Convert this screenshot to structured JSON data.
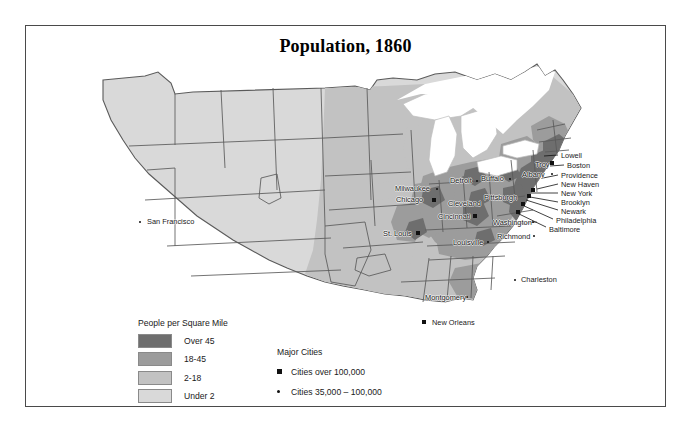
{
  "map": {
    "title": "Population, 1860",
    "colors": {
      "over45": "#6e6e6e",
      "d18_45": "#9c9c9c",
      "d2_18": "#c2c2c2",
      "under2": "#d9d9d9",
      "water": "#ffffff",
      "border": "#4a4a4a",
      "marker": "#111111"
    },
    "legend_density": {
      "title": "People per Square Mile",
      "classes": [
        {
          "label": "Over 45",
          "color": "#6e6e6e"
        },
        {
          "label": "18-45",
          "color": "#9c9c9c"
        },
        {
          "label": "2-18",
          "color": "#c2c2c2"
        },
        {
          "label": "Under 2",
          "color": "#d9d9d9"
        }
      ]
    },
    "legend_cities": {
      "title": "Major Cities",
      "classes": [
        {
          "label": "Cities over 100,000",
          "marker": "square-marker"
        },
        {
          "label": "Cities 35,000 – 100,000",
          "marker": "dot-marker"
        }
      ]
    },
    "cities": [
      {
        "name": "San Francisco",
        "marker": "dot-marker",
        "mx": 115,
        "my": 172,
        "lx": 122,
        "ly": 168
      },
      {
        "name": "Milwaukee",
        "marker": "dot-marker",
        "mx": 412,
        "my": 139,
        "lx": 370,
        "ly": 135
      },
      {
        "name": "Chicago",
        "marker": "square-marker",
        "mx": 409,
        "my": 150,
        "lx": 371,
        "ly": 146
      },
      {
        "name": "St. Louis",
        "marker": "square-marker",
        "mx": 393,
        "my": 183,
        "lx": 358,
        "ly": 180
      },
      {
        "name": "Detroit",
        "marker": "dot-marker",
        "mx": 452,
        "my": 131,
        "lx": 425,
        "ly": 127
      },
      {
        "name": "Buffalo",
        "marker": "dot-marker",
        "mx": 485,
        "my": 129,
        "lx": 456,
        "ly": 125
      },
      {
        "name": "Cleveland",
        "marker": "dot-marker",
        "mx": 453,
        "my": 152,
        "lx": 423,
        "ly": 150
      },
      {
        "name": "Cincinnati",
        "marker": "square-marker",
        "mx": 450,
        "my": 166,
        "lx": 413,
        "ly": 163
      },
      {
        "name": "Pittsburgh",
        "marker": "dot-marker",
        "mx": 487,
        "my": 147,
        "lx": 459,
        "ly": 144
      },
      {
        "name": "Louisville",
        "marker": "dot-marker",
        "mx": 463,
        "my": 192,
        "lx": 428,
        "ly": 189
      },
      {
        "name": "Washington",
        "marker": "dot-marker",
        "mx": 508,
        "my": 172,
        "lx": 468,
        "ly": 169
      },
      {
        "name": "Richmond",
        "marker": "dot-marker",
        "mx": 509,
        "my": 186,
        "lx": 472,
        "ly": 183
      },
      {
        "name": "Troy",
        "marker": "dot-marker",
        "mx": 527,
        "my": 114,
        "lx": 510,
        "ly": 111
      },
      {
        "name": "Albany",
        "marker": "dot-marker",
        "mx": 527,
        "my": 124,
        "lx": 497,
        "ly": 121
      },
      {
        "name": "Charleston",
        "marker": "dot-marker",
        "mx": 490,
        "my": 230,
        "lx": 496,
        "ly": 226
      },
      {
        "name": "Montgomery",
        "marker": "dot-marker",
        "mx": 442,
        "my": 247,
        "lx": 400,
        "ly": 244
      },
      {
        "name": "New Orleans",
        "marker": "square-marker",
        "mx": 399,
        "my": 272,
        "lx": 407,
        "ly": 269
      }
    ],
    "coast_labels": [
      {
        "name": "Lowell",
        "lx": 536,
        "ly": 102,
        "ax": 533,
        "ay": 105,
        "bx": 519,
        "by": 106
      },
      {
        "name": "Boston",
        "lx": 542,
        "ly": 112,
        "ax": 539,
        "ay": 115,
        "bx": 525,
        "by": 116
      },
      {
        "name": "Providence",
        "lx": 536,
        "ly": 122,
        "ax": 533,
        "ay": 125,
        "bx": 518,
        "by": 128
      },
      {
        "name": "New Haven",
        "lx": 536,
        "ly": 131,
        "ax": 533,
        "ay": 134,
        "bx": 512,
        "by": 139
      },
      {
        "name": "New York",
        "lx": 536,
        "ly": 140,
        "ax": 533,
        "ay": 143,
        "bx": 506,
        "by": 143
      },
      {
        "name": "Brooklyn",
        "lx": 536,
        "ly": 149,
        "ax": 533,
        "ay": 152,
        "bx": 505,
        "by": 147
      },
      {
        "name": "Newark",
        "lx": 536,
        "ly": 158,
        "ax": 533,
        "ay": 160,
        "bx": 501,
        "by": 150
      },
      {
        "name": "Philadelphia",
        "lx": 531,
        "ly": 167,
        "ax": 528,
        "ay": 169,
        "bx": 497,
        "by": 155
      },
      {
        "name": "Baltimore",
        "lx": 524,
        "ly": 176,
        "ax": 521,
        "ay": 177,
        "bx": 492,
        "by": 163
      }
    ],
    "coast_markers": [
      {
        "name": "Boston-marker",
        "marker": "square-marker",
        "mx": 527,
        "my": 113
      },
      {
        "name": "New-York-marker",
        "marker": "square-marker",
        "mx": 508,
        "my": 140
      },
      {
        "name": "Brooklyn-marker",
        "marker": "square-marker",
        "mx": 504,
        "my": 146
      },
      {
        "name": "Philadelphia-marker",
        "marker": "square-marker",
        "mx": 498,
        "my": 154
      },
      {
        "name": "Baltimore-marker",
        "marker": "square-marker",
        "mx": 493,
        "my": 162
      }
    ]
  }
}
